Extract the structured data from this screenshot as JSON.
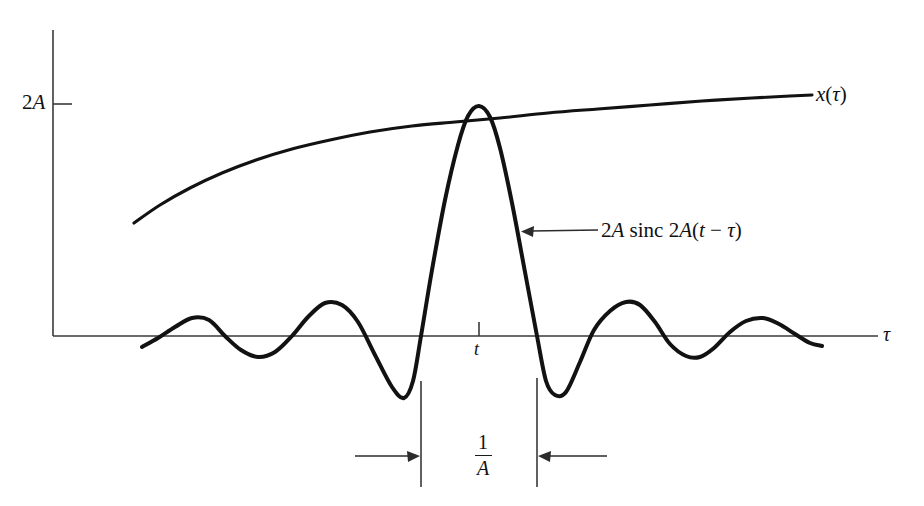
{
  "figure": {
    "kind": "signal-processing-diagram",
    "background_color": "#ffffff",
    "ink_color": "#121212",
    "axis_color": "#3a3a3a",
    "labels": {
      "y_tick_2a": "2A",
      "x_axis_name": "τ",
      "envelope_curve_name": "x(τ)",
      "envelope_curve_prefix": "x",
      "envelope_curve_open": "(",
      "envelope_curve_var": "τ",
      "envelope_curve_close": ")",
      "sample_point": "t",
      "callout_full": "2A sinc 2A(t − τ)",
      "callout_amp": "2A",
      "callout_fn": "sinc",
      "callout_arg_amp": "2A",
      "callout_arg_open": "(",
      "callout_arg_t": "t",
      "callout_arg_minus": "−",
      "callout_arg_tau": "τ",
      "callout_arg_close": ")",
      "width_numerator": "1",
      "width_denominator": "A",
      "width_full": "1/A"
    }
  },
  "chart_data": {
    "type": "line",
    "title": "",
    "xlabel": "τ",
    "ylabel": "",
    "grid": false,
    "legend_position": "inline-annotations",
    "axes": {
      "y_axis_x_px": 53,
      "y_axis_top_px": 30,
      "y_axis_bottom_px": 336,
      "x_axis_y_px": 336,
      "x_axis_left_px": 53,
      "x_axis_right_px": 878,
      "y_tick_2a_y_px": 104,
      "y_tick_2a_value": "2A",
      "x_tick_t_px": 479,
      "x_tick_t_value": "t"
    },
    "series": [
      {
        "name": "x(τ)",
        "role": "envelope",
        "description": "slowly varying concave signal rising toward 2A",
        "points_px": [
          [
            134,
            223
          ],
          [
            160,
            205
          ],
          [
            190,
            188
          ],
          [
            222,
            173
          ],
          [
            256,
            160
          ],
          [
            292,
            149
          ],
          [
            330,
            140
          ],
          [
            370,
            132
          ],
          [
            412,
            126
          ],
          [
            455,
            122
          ],
          [
            500,
            118
          ],
          [
            548,
            113
          ],
          [
            598,
            109
          ],
          [
            650,
            105
          ],
          [
            702,
            101
          ],
          [
            752,
            98
          ],
          [
            790,
            96
          ],
          [
            812,
            95
          ]
        ]
      },
      {
        "name": "2A sinc 2A(t − τ)",
        "role": "sinc",
        "description": "sinc kernel centered at t with main lobe reaching 2A; zero crossings at t ± 1/(2A)",
        "center_px": 479,
        "peak_px": [
          479,
          106
        ],
        "zero_crossings_px": [
          421,
          537
        ],
        "main_lobe_width_px": 116,
        "points_px": [
          [
            142,
            347
          ],
          [
            158,
            338
          ],
          [
            175,
            327
          ],
          [
            192,
            318
          ],
          [
            209,
            320
          ],
          [
            225,
            336
          ],
          [
            241,
            350
          ],
          [
            258,
            357
          ],
          [
            275,
            352
          ],
          [
            292,
            336
          ],
          [
            308,
            317
          ],
          [
            325,
            303
          ],
          [
            342,
            305
          ],
          [
            358,
            322
          ],
          [
            375,
            355
          ],
          [
            392,
            387
          ],
          [
            404,
            398
          ],
          [
            413,
            381
          ],
          [
            421,
            336
          ],
          [
            432,
            270
          ],
          [
            445,
            200
          ],
          [
            458,
            145
          ],
          [
            468,
            116
          ],
          [
            479,
            106
          ],
          [
            490,
            117
          ],
          [
            500,
            148
          ],
          [
            512,
            203
          ],
          [
            525,
            272
          ],
          [
            537,
            336
          ],
          [
            546,
            381
          ],
          [
            555,
            395
          ],
          [
            566,
            392
          ],
          [
            580,
            362
          ],
          [
            594,
            330
          ],
          [
            610,
            311
          ],
          [
            626,
            302
          ],
          [
            640,
            305
          ],
          [
            655,
            322
          ],
          [
            670,
            344
          ],
          [
            686,
            356
          ],
          [
            700,
            357
          ],
          [
            714,
            348
          ],
          [
            730,
            332
          ],
          [
            746,
            321
          ],
          [
            763,
            318
          ],
          [
            779,
            324
          ],
          [
            795,
            334
          ],
          [
            810,
            343
          ],
          [
            822,
            346
          ]
        ]
      }
    ],
    "annotations": [
      {
        "name": "callout-sinc",
        "text": "2A sinc 2A(t − τ)",
        "text_anchor_px": [
          601,
          230
        ],
        "arrow_from_px": [
          598,
          230
        ],
        "arrow_to_px": [
          522,
          231
        ]
      },
      {
        "name": "dimension-one-over-a",
        "text": "1/A",
        "label_center_px": [
          483,
          456
        ],
        "extension_left_px": 421,
        "extension_right_px": 537,
        "extension_top_left_px": 381,
        "extension_top_right_px": 378,
        "extension_bottom_px": 487,
        "arrow_axis_y_px": 456,
        "arrow_left_tail_px": 355,
        "arrow_right_tail_px": 607
      }
    ]
  }
}
